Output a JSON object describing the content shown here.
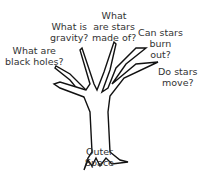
{
  "diagram": {
    "type": "question-tree",
    "trunk_label": [
      "Outer",
      "Space"
    ],
    "branches": [
      {
        "lines": [
          "What are",
          "black holes?"
        ]
      },
      {
        "lines": [
          "What is",
          "gravity?"
        ]
      },
      {
        "lines": [
          "What",
          "are stars",
          "made of?"
        ]
      },
      {
        "lines": [
          "Can stars",
          "burn",
          "out?"
        ]
      },
      {
        "lines": [
          "Do stars",
          "move?"
        ]
      }
    ],
    "colors": {
      "stroke": "#111111",
      "text": "#333333",
      "background": "#ffffff"
    }
  }
}
